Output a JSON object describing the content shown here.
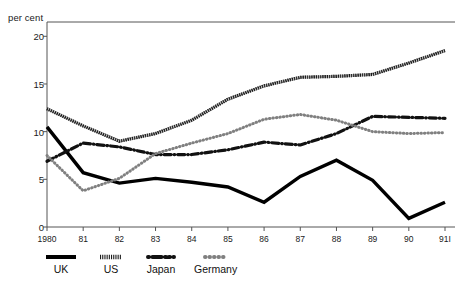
{
  "chart_data": {
    "type": "line",
    "title": "",
    "subtitle": "",
    "ylabel": "per cent",
    "xlabel": "",
    "ylim": [
      0,
      21.5
    ],
    "yticks": [
      0,
      5,
      10,
      15,
      20
    ],
    "ytick_labels": [
      "0",
      "5",
      "10",
      "15",
      "20"
    ],
    "grid": false,
    "legend_position": "bottom-left",
    "categories": [
      "1980",
      "81",
      "82",
      "83",
      "84",
      "85",
      "86",
      "87",
      "88",
      "89",
      "90",
      "91I"
    ],
    "x": [
      1980,
      1981,
      1982,
      1983,
      1984,
      1985,
      1986,
      1987,
      1988,
      1989,
      1990,
      1991
    ],
    "series": [
      {
        "name": "UK",
        "style": "solid-thick",
        "color": "#000000",
        "values": [
          10.5,
          5.7,
          4.6,
          5.1,
          4.7,
          4.2,
          2.6,
          5.3,
          7.0,
          4.9,
          0.9,
          2.6
        ]
      },
      {
        "name": "US",
        "style": "fine-hatched",
        "color": "#1a1a1a",
        "values": [
          12.4,
          10.6,
          9.0,
          9.8,
          11.2,
          13.4,
          14.8,
          15.7,
          15.8,
          16.0,
          17.2,
          18.5
        ]
      },
      {
        "name": "Japan",
        "style": "dash-dot",
        "color": "#111111",
        "values": [
          6.9,
          8.8,
          8.4,
          7.6,
          7.6,
          8.1,
          8.9,
          8.6,
          9.8,
          11.6,
          11.5,
          11.4
        ]
      },
      {
        "name": "Germany",
        "style": "dotted-round",
        "color": "#808080",
        "values": [
          7.5,
          3.8,
          5.1,
          7.7,
          8.8,
          9.8,
          11.3,
          11.8,
          11.2,
          10.0,
          9.8,
          9.9
        ]
      }
    ]
  },
  "legend": {
    "entries": [
      {
        "label": "UK",
        "swatch": "solid-thick-swatch"
      },
      {
        "label": "US",
        "swatch": "fine-hatched-swatch"
      },
      {
        "label": "Japan",
        "swatch": "dash-dot-swatch"
      },
      {
        "label": "Germany",
        "swatch": "dotted-round-swatch"
      }
    ]
  }
}
